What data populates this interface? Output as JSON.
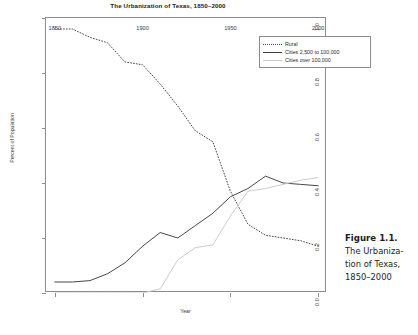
{
  "chart_data": {
    "type": "line",
    "title": "The Urbanization of Texas, 1850–2000",
    "xlabel": "Year",
    "ylabel": "Percent of Population",
    "xlim": [
      1845,
      2005
    ],
    "ylim": [
      0.0,
      1.0
    ],
    "grid": false,
    "legend_position": "top-right",
    "xticks": [
      "1850",
      "1900",
      "1950",
      "2000"
    ],
    "xtick_values": [
      1850,
      1900,
      1950,
      2000
    ],
    "yticks": [
      "0.0",
      "0.2",
      "0.4",
      "0.6",
      "0.8",
      "1.0"
    ],
    "ytick_values": [
      0.0,
      0.2,
      0.4,
      0.6,
      0.8,
      1.0
    ],
    "x": [
      1850,
      1860,
      1870,
      1880,
      1890,
      1900,
      1910,
      1920,
      1930,
      1940,
      1950,
      1960,
      1970,
      1980,
      1990,
      2000
    ],
    "series": [
      {
        "name": "Rural",
        "style": "dotted",
        "color": "#4a4a4a",
        "values": [
          0.96,
          0.96,
          0.93,
          0.91,
          0.84,
          0.83,
          0.76,
          0.68,
          0.59,
          0.55,
          0.37,
          0.25,
          0.21,
          0.2,
          0.19,
          0.17
        ]
      },
      {
        "name": "Cities 2,500 to 100,000",
        "style": "solid",
        "color": "#3d3d3d",
        "values": [
          0.04,
          0.04,
          0.045,
          0.07,
          0.11,
          0.17,
          0.22,
          0.2,
          0.245,
          0.29,
          0.35,
          0.38,
          0.425,
          0.4,
          0.395,
          0.39
        ]
      },
      {
        "name": "Cities over 100,000",
        "style": "solid",
        "color": "#c9c9c9",
        "values": [
          0.0,
          0.0,
          0.0,
          0.0,
          0.0,
          0.0,
          0.015,
          0.12,
          0.165,
          0.175,
          0.28,
          0.37,
          0.38,
          0.395,
          0.41,
          0.42
        ]
      }
    ]
  },
  "legend": {
    "items": [
      {
        "label": "Rural"
      },
      {
        "label": "Cities 2,500 to 100,000"
      },
      {
        "label": "Cities over 100,000"
      }
    ]
  },
  "caption": {
    "figure_number": "Figure 1.1.",
    "line1": "The Urbaniza-",
    "line2": "tion of Texas,",
    "line3": "1850–2000"
  }
}
